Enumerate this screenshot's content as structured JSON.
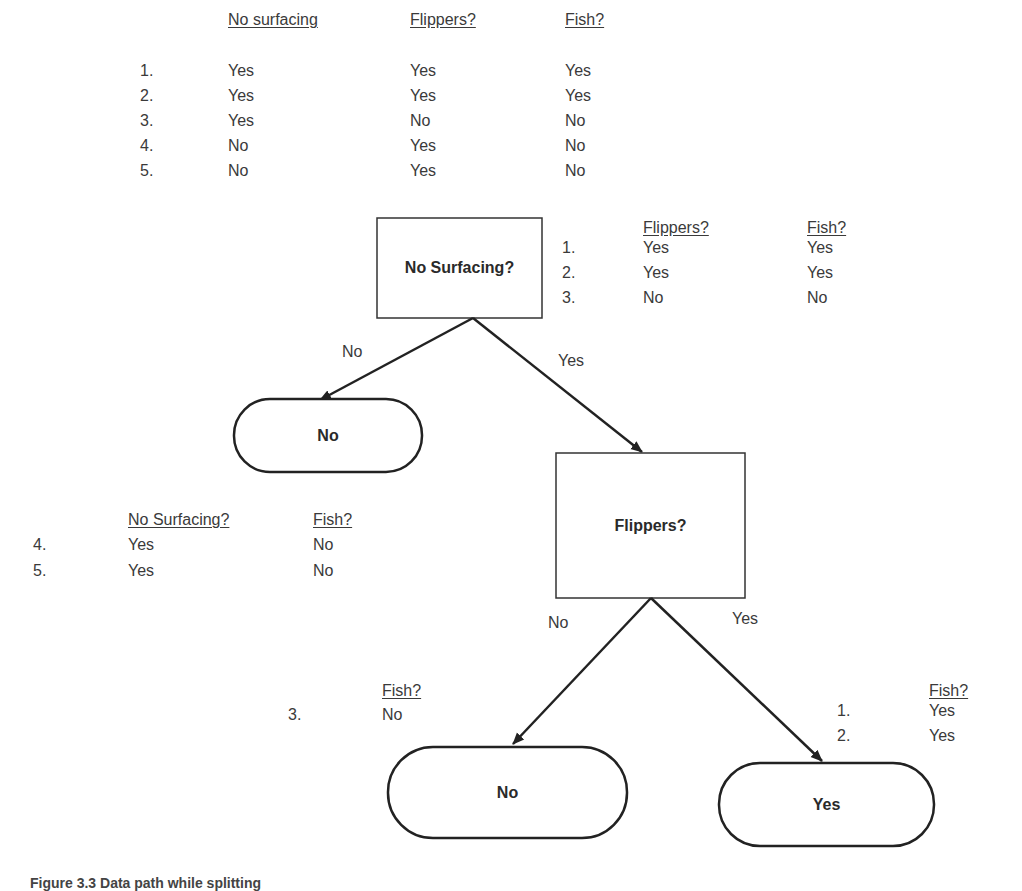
{
  "top_table": {
    "headers": [
      "No surfacing",
      "Flippers?",
      "Fish?"
    ],
    "rows": [
      {
        "num": "1.",
        "cells": [
          "Yes",
          "Yes",
          "Yes"
        ]
      },
      {
        "num": "2.",
        "cells": [
          "Yes",
          "Yes",
          "Yes"
        ]
      },
      {
        "num": "3.",
        "cells": [
          "Yes",
          "No",
          "No"
        ]
      },
      {
        "num": "4.",
        "cells": [
          "No",
          "Yes",
          "No"
        ]
      },
      {
        "num": "5.",
        "cells": [
          "No",
          "Yes",
          "No"
        ]
      }
    ]
  },
  "yes_branch_table": {
    "headers": [
      "Flippers?",
      "Fish?"
    ],
    "rows": [
      {
        "num": "1.",
        "cells": [
          "Yes",
          "Yes"
        ]
      },
      {
        "num": "2.",
        "cells": [
          "Yes",
          "Yes"
        ]
      },
      {
        "num": "3.",
        "cells": [
          "No",
          "No"
        ]
      }
    ]
  },
  "no_branch_table": {
    "headers": [
      "No Surfacing?",
      "Fish?"
    ],
    "rows": [
      {
        "num": "4.",
        "cells": [
          "Yes",
          "No"
        ]
      },
      {
        "num": "5.",
        "cells": [
          "Yes",
          "No"
        ]
      }
    ]
  },
  "flippers_no_table": {
    "headers": [
      "Fish?"
    ],
    "rows": [
      {
        "num": "3.",
        "cells": [
          "No"
        ]
      }
    ]
  },
  "flippers_yes_table": {
    "headers": [
      "Fish?"
    ],
    "rows": [
      {
        "num": "1.",
        "cells": [
          "Yes"
        ]
      },
      {
        "num": "2.",
        "cells": [
          "Yes"
        ]
      }
    ]
  },
  "tree": {
    "root": {
      "label": "No Surfacing?"
    },
    "root_edges": {
      "no": "No",
      "yes": "Yes"
    },
    "leaf_root_no": {
      "label": "No"
    },
    "flippers": {
      "label": "Flippers?"
    },
    "flippers_edges": {
      "no": "No",
      "yes": "Yes"
    },
    "leaf_flippers_no": {
      "label": "No"
    },
    "leaf_flippers_yes": {
      "label": "Yes"
    }
  },
  "caption": "Figure 3.3 Data path while splitting"
}
